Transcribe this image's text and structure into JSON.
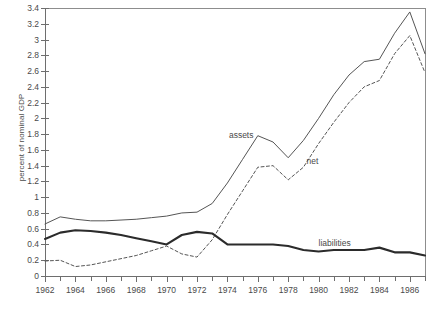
{
  "chart_data": {
    "type": "line",
    "title": "",
    "xlabel": "",
    "ylabel": "percent of nominal GDP",
    "xlim": [
      1962,
      1987
    ],
    "ylim": [
      0,
      3.4
    ],
    "grid": false,
    "legend_position": "inline-annotations",
    "ytick_labels": [
      "0",
      "0.2",
      "0.4",
      "0.6",
      "0.8",
      "1",
      "1.2",
      "1.4",
      "1.6",
      "1.8",
      "2",
      "2.2",
      "2.4",
      "2.6",
      "2.8",
      "3",
      "3.2",
      "3.4"
    ],
    "ytick_values": [
      0,
      0.2,
      0.4,
      0.6,
      0.8,
      1,
      1.2,
      1.4,
      1.6,
      1.8,
      2,
      2.2,
      2.4,
      2.6,
      2.8,
      3,
      3.2,
      3.4
    ],
    "xtick_labels": [
      "1962",
      "1964",
      "1966",
      "1968",
      "1970",
      "1972",
      "1974",
      "1976",
      "1978",
      "1980",
      "1982",
      "1984",
      "1986"
    ],
    "xtick_values": [
      1962,
      1964,
      1966,
      1968,
      1970,
      1972,
      1974,
      1976,
      1978,
      1980,
      1982,
      1984,
      1986
    ],
    "xminor_values": [
      1963,
      1965,
      1967,
      1969,
      1971,
      1973,
      1975,
      1977,
      1979,
      1981,
      1983,
      1985,
      1987
    ],
    "x": [
      1962,
      1963,
      1964,
      1965,
      1966,
      1967,
      1968,
      1969,
      1970,
      1971,
      1972,
      1973,
      1974,
      1975,
      1976,
      1977,
      1978,
      1979,
      1980,
      1981,
      1982,
      1983,
      1984,
      1985,
      1986,
      1987
    ],
    "series": [
      {
        "name": "assets",
        "style": "solid-thin",
        "color": "#555555",
        "label_x": 1974.1,
        "label_y": 1.78,
        "values": [
          0.66,
          0.75,
          0.72,
          0.7,
          0.7,
          0.71,
          0.72,
          0.74,
          0.76,
          0.8,
          0.81,
          0.92,
          1.18,
          1.48,
          1.78,
          1.7,
          1.5,
          1.72,
          2.0,
          2.3,
          2.55,
          2.72,
          2.75,
          3.08,
          3.35,
          2.82
        ]
      },
      {
        "name": "net",
        "style": "dashed",
        "color": "#555555",
        "label_x": 1979.2,
        "label_y": 1.45,
        "values": [
          0.19,
          0.2,
          0.12,
          0.14,
          0.18,
          0.22,
          0.26,
          0.32,
          0.38,
          0.28,
          0.24,
          0.46,
          0.78,
          1.08,
          1.38,
          1.4,
          1.22,
          1.38,
          1.68,
          1.95,
          2.2,
          2.4,
          2.48,
          2.82,
          3.05,
          2.58
        ]
      },
      {
        "name": "liabilities",
        "style": "solid-thick",
        "color": "#2b2b2b",
        "label_x": 1980.0,
        "label_y": 0.4,
        "values": [
          0.47,
          0.55,
          0.58,
          0.57,
          0.55,
          0.52,
          0.48,
          0.44,
          0.4,
          0.52,
          0.56,
          0.54,
          0.4,
          0.4,
          0.4,
          0.4,
          0.38,
          0.33,
          0.31,
          0.33,
          0.33,
          0.33,
          0.36,
          0.3,
          0.3,
          0.26
        ]
      }
    ],
    "annotations": [
      {
        "text": "assets",
        "x": 1974.1,
        "y": 1.78
      },
      {
        "text": "net",
        "x": 1979.2,
        "y": 1.45
      },
      {
        "text": "liabilities",
        "x": 1980.0,
        "y": 0.4
      }
    ]
  },
  "caption": ""
}
